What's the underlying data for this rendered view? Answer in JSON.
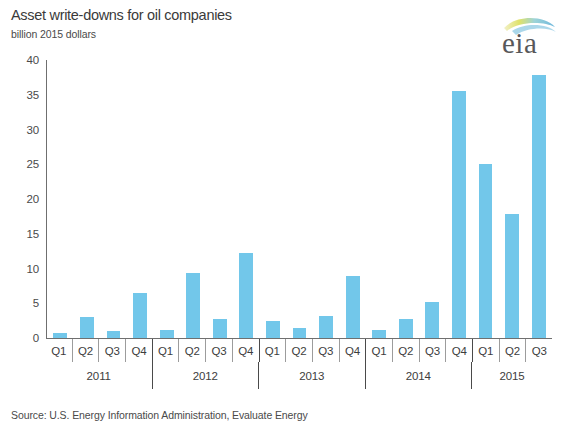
{
  "header": {
    "title": "Asset write-downs for oil companies",
    "subtitle": "billion 2015 dollars",
    "logo_text": "eia"
  },
  "source": {
    "note": "Source: U.S. Energy Information Administration, Evaluate Energy"
  },
  "chart_data": {
    "type": "bar",
    "title": "Asset write-downs for oil companies",
    "subtitle": "billion 2015 dollars",
    "xlabel": "",
    "ylabel": "billion 2015 dollars",
    "ylim": [
      0,
      40
    ],
    "yticks": [
      0,
      5,
      10,
      15,
      20,
      25,
      30,
      35,
      40
    ],
    "ytick_labels": [
      "0",
      "5",
      "10",
      "15",
      "20",
      "25",
      "30",
      "35",
      "40"
    ],
    "grid": false,
    "legend": "none",
    "bar_color": "#72c7ea",
    "categories": [
      "Q1",
      "Q2",
      "Q3",
      "Q4",
      "Q1",
      "Q2",
      "Q3",
      "Q4",
      "Q1",
      "Q2",
      "Q3",
      "Q4",
      "Q1",
      "Q2",
      "Q3",
      "Q4",
      "Q1",
      "Q2",
      "Q3"
    ],
    "values": [
      0.7,
      3.0,
      1.0,
      6.5,
      1.2,
      9.3,
      2.7,
      12.3,
      2.5,
      1.5,
      3.2,
      8.9,
      1.2,
      2.8,
      5.2,
      35.5,
      25.1,
      17.8,
      37.9
    ],
    "year_groups": [
      {
        "label": "2011",
        "quarters": 4
      },
      {
        "label": "2012",
        "quarters": 4
      },
      {
        "label": "2013",
        "quarters": 4
      },
      {
        "label": "2014",
        "quarters": 4
      },
      {
        "label": "2015",
        "quarters": 3
      }
    ]
  }
}
